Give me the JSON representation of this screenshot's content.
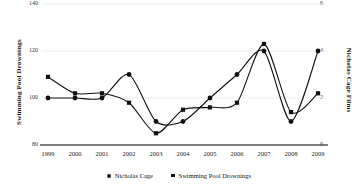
{
  "chart_data": {
    "type": "line",
    "title": "",
    "xlabel": "",
    "categories": [
      "1999",
      "2000",
      "2001",
      "2002",
      "2003",
      "2004",
      "2005",
      "2006",
      "2007",
      "2008",
      "2009"
    ],
    "grid": true,
    "legend_position": "bottom",
    "axes": {
      "left": {
        "label": "Swimming Pool Drownings",
        "ticks": [
          "140",
          "120",
          "100",
          "80"
        ],
        "tick_values": [
          140,
          120,
          100,
          80
        ],
        "ylim": [
          80,
          140
        ]
      },
      "right": {
        "label": "Nicholas Cage Films",
        "ticks": [
          "6",
          "4",
          "2",
          "0"
        ],
        "tick_values": [
          6,
          4,
          2,
          0
        ],
        "ylim": [
          0,
          6
        ]
      }
    },
    "series": [
      {
        "name": "Nicholas Cage",
        "marker": "circle",
        "axis": "right",
        "values": [
          2,
          2,
          2,
          3,
          1,
          1,
          2,
          3,
          4,
          1,
          4
        ]
      },
      {
        "name": "Swimming Pool Drownings",
        "marker": "square",
        "axis": "left",
        "values": [
          109,
          102,
          102,
          98,
          85,
          95,
          96,
          98,
          123,
          94,
          102
        ]
      }
    ]
  },
  "legend": {
    "items": [
      {
        "label": "Nicholas Cage",
        "marker": "circle"
      },
      {
        "label": "Swimming Pool Drownings",
        "marker": "square"
      }
    ]
  },
  "colors": {
    "line": "#111111",
    "marker": "#111111",
    "grid": "#eeeeee",
    "axis": "#555555",
    "background": "#ffffff"
  }
}
